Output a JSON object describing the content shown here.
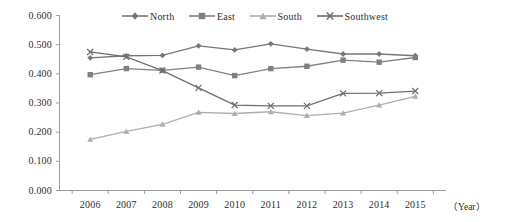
{
  "chart_data": {
    "type": "line",
    "title": "",
    "xlabel": "（Year）",
    "ylabel": "",
    "categories": [
      "2006",
      "2007",
      "2008",
      "2009",
      "2010",
      "2011",
      "2012",
      "2013",
      "2014",
      "2015"
    ],
    "ytick_labels": [
      "0.600",
      "0.500",
      "0.400",
      "0.300",
      "0.200",
      "0.100",
      "0.000"
    ],
    "ylim": [
      0.0,
      0.6
    ],
    "ytick_step": 0.1,
    "grid": false,
    "legend_position": "top-center",
    "series": [
      {
        "name": "North",
        "marker": "diamond",
        "color": "#777777",
        "values": [
          0.455,
          0.462,
          0.463,
          0.496,
          0.482,
          0.503,
          0.485,
          0.468,
          0.468,
          0.462
        ]
      },
      {
        "name": "East",
        "marker": "square",
        "color": "#808080",
        "values": [
          0.397,
          0.418,
          0.412,
          0.423,
          0.394,
          0.418,
          0.426,
          0.447,
          0.44,
          0.456
        ]
      },
      {
        "name": "South",
        "marker": "triangle",
        "color": "#aeaeae",
        "values": [
          0.175,
          0.203,
          0.227,
          0.268,
          0.264,
          0.27,
          0.257,
          0.265,
          0.293,
          0.323
        ]
      },
      {
        "name": "Southwest",
        "marker": "cross",
        "color": "#6e6e6e",
        "values": [
          0.475,
          0.458,
          0.411,
          0.352,
          0.293,
          0.29,
          0.29,
          0.333,
          0.334,
          0.341
        ]
      }
    ]
  },
  "axes": {
    "axis_color": "#9b9b9b",
    "text_color": "#2e2e2e"
  }
}
